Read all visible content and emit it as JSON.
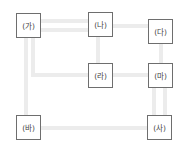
{
  "diagram": {
    "type": "network",
    "colors": {
      "node_border": "#6e6e6e",
      "connector": "#ececec",
      "text": "#444444",
      "background": "#ffffff"
    },
    "nodes": [
      {
        "id": "ga",
        "label": "(가)"
      },
      {
        "id": "na",
        "label": "(나)"
      },
      {
        "id": "da",
        "label": "(다)"
      },
      {
        "id": "ra",
        "label": "(라)"
      },
      {
        "id": "ma",
        "label": "(마)"
      },
      {
        "id": "ba",
        "label": "(바)"
      },
      {
        "id": "sa",
        "label": "(사)"
      }
    ],
    "edges": [
      {
        "from": "(가)",
        "to": "(나)",
        "style": "double"
      },
      {
        "from": "(가)",
        "to": "(라)",
        "style": "double"
      },
      {
        "from": "(가)",
        "to": "(바)",
        "style": "single"
      },
      {
        "from": "(나)",
        "to": "(다)",
        "style": "single"
      },
      {
        "from": "(나)",
        "to": "(라)",
        "style": "single"
      },
      {
        "from": "(다)",
        "to": "(마)",
        "style": "single"
      },
      {
        "from": "(라)",
        "to": "(마)",
        "style": "single"
      },
      {
        "from": "(마)",
        "to": "(사)",
        "style": "double"
      },
      {
        "from": "(바)",
        "to": "(사)",
        "style": "single"
      }
    ]
  }
}
